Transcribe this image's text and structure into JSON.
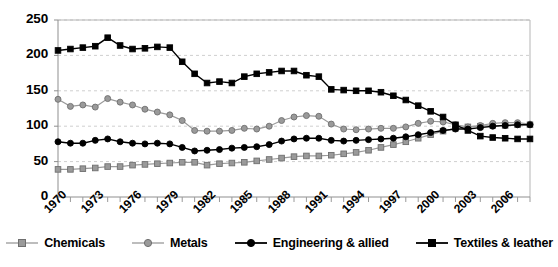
{
  "chart_data": {
    "type": "line",
    "title": "",
    "xlabel": "",
    "ylabel": "",
    "ylim": [
      0,
      250
    ],
    "ytick_values": [
      250,
      200,
      150,
      100,
      50,
      0
    ],
    "ytick_labels": [
      "250",
      "200",
      "150",
      "100",
      "50",
      "0"
    ],
    "grid": true,
    "grid_axis": "y",
    "legend_position": "bottom",
    "x": [
      1970,
      1971,
      1972,
      1973,
      1974,
      1975,
      1976,
      1977,
      1978,
      1979,
      1980,
      1981,
      1982,
      1983,
      1984,
      1985,
      1986,
      1987,
      1988,
      1989,
      1990,
      1991,
      1992,
      1993,
      1994,
      1995,
      1996,
      1997,
      1998,
      1999,
      2000,
      2001,
      2002,
      2003,
      2004,
      2005,
      2006,
      2007,
      2008
    ],
    "xtick_labels": [
      "1970",
      "1973",
      "1976",
      "1979",
      "1982",
      "1985",
      "1988",
      "1991",
      "1994",
      "1997",
      "2000",
      "2003",
      "2006"
    ],
    "xtick_years": [
      1970,
      1973,
      1976,
      1979,
      1982,
      1985,
      1988,
      1991,
      1994,
      1997,
      2000,
      2003,
      2006
    ],
    "series": [
      {
        "name": "Chemicals",
        "color": "#9a9a9a",
        "marker": "square",
        "values": [
          39,
          39,
          40,
          41,
          43,
          43,
          45,
          46,
          47,
          48,
          49,
          49,
          45,
          47,
          48,
          49,
          51,
          53,
          55,
          57,
          58,
          58,
          59,
          61,
          63,
          66,
          70,
          74,
          78,
          83,
          88,
          93,
          97,
          99,
          100,
          101,
          101,
          102,
          102
        ]
      },
      {
        "name": "Metals",
        "color": "#9a9a9a",
        "marker": "circle",
        "values": [
          138,
          128,
          130,
          127,
          139,
          134,
          130,
          124,
          120,
          116,
          108,
          94,
          93,
          93,
          94,
          97,
          96,
          100,
          108,
          113,
          115,
          114,
          103,
          96,
          95,
          96,
          97,
          97,
          99,
          104,
          107,
          106,
          102,
          99,
          101,
          104,
          105,
          105,
          103
        ]
      },
      {
        "name": "Engineering & allied",
        "color": "#000000",
        "marker": "circle",
        "values": [
          78,
          76,
          76,
          80,
          82,
          78,
          76,
          75,
          76,
          75,
          70,
          65,
          66,
          67,
          69,
          70,
          71,
          74,
          79,
          82,
          83,
          83,
          80,
          79,
          80,
          81,
          82,
          83,
          85,
          88,
          91,
          94,
          96,
          96,
          98,
          100,
          101,
          102,
          102
        ]
      },
      {
        "name": "Textiles & leather",
        "color": "#000000",
        "marker": "square",
        "values": [
          207,
          209,
          211,
          213,
          225,
          214,
          209,
          210,
          212,
          211,
          191,
          174,
          161,
          163,
          161,
          170,
          174,
          176,
          178,
          178,
          172,
          170,
          152,
          151,
          150,
          150,
          148,
          143,
          137,
          129,
          121,
          113,
          102,
          94,
          86,
          84,
          83,
          82,
          82
        ]
      }
    ]
  },
  "legend": {
    "items": [
      {
        "label": "Chemicals"
      },
      {
        "label": "Metals"
      },
      {
        "label": "Engineering & allied"
      },
      {
        "label": "Textiles & leather"
      }
    ]
  }
}
